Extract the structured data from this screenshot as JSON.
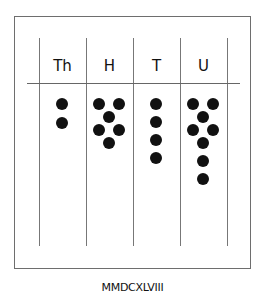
{
  "diagram": {
    "columns": [
      {
        "label": "Th",
        "count": 2
      },
      {
        "label": "H",
        "count": 6
      },
      {
        "label": "T",
        "count": 4
      },
      {
        "label": "U",
        "count": 8
      }
    ],
    "caption": "MMDCXLVIII"
  }
}
